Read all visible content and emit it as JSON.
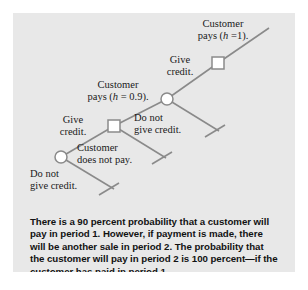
{
  "figure": {
    "background_color": "#e8e8e8",
    "line_color": "#8a8a8a",
    "node_fill": "#ffffff",
    "text_color": "#1a1a1a"
  },
  "diagram": {
    "type": "decision-tree",
    "nodes": [
      {
        "id": "root",
        "shape": "circle",
        "x": 48,
        "y": 144
      },
      {
        "id": "decision-1",
        "shape": "square",
        "x": 101,
        "y": 113
      },
      {
        "id": "chance-1",
        "shape": "circle",
        "x": 154,
        "y": 86
      },
      {
        "id": "decision-2",
        "shape": "square",
        "x": 205,
        "y": 50
      }
    ],
    "labels": {
      "root_up": "Give\ncredit.",
      "root_down": "Do not\ngive credit.",
      "decision1_up": "Customer\npays (h = 0.9).",
      "decision1_down": "Customer\ndoes not pay.",
      "chance1_up": "Give\ncredit.",
      "chance1_down": "Do not\ngive credit.",
      "decision2_up": "Customer\npays (h =1)."
    }
  },
  "labels": {
    "give_credit": {
      "line1": "Give",
      "line2": "credit."
    },
    "do_not_give_credit": {
      "line1": "Do not",
      "line2": "give credit."
    },
    "customer_pays_09": {
      "line1": "Customer",
      "line2_pre": "pays (",
      "line2_var": "h",
      "line2_post": " = 0.9)."
    },
    "customer_does_not_pay": {
      "line1": "Customer",
      "line2": "does not pay."
    },
    "give_credit_2": {
      "line1": "Give",
      "line2": "credit."
    },
    "do_not_give_credit_2": {
      "line1": "Do not",
      "line2": "give credit."
    },
    "customer_pays_1": {
      "line1": "Customer",
      "line2_pre": "pays (",
      "line2_var": "h",
      "line2_post": " =1)."
    }
  },
  "caption": {
    "text": "There is a 90 percent probability that a customer will pay in period 1. However, if payment is made, there will be another sale in period 2. The probability that the customer will pay in period 2 is 100 percent—if the customer has paid in period 1."
  }
}
